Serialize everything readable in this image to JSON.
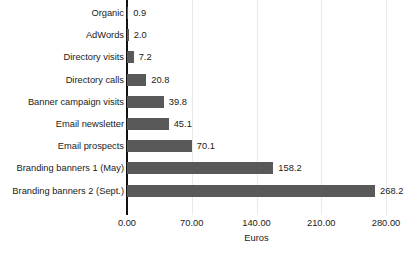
{
  "chart_data": {
    "type": "bar",
    "orientation": "horizontal",
    "title": "",
    "xlabel": "Euros",
    "ylabel": "",
    "categories": [
      "Organic",
      "AdWords",
      "Directory visits",
      "Directory calls",
      "Banner campaign visits",
      "Email newsletter",
      "Email prospects",
      "Branding banners 1 (May)",
      "Branding banners 2 (Sept.)"
    ],
    "values": [
      0.9,
      2.0,
      7.2,
      20.8,
      39.8,
      45.1,
      70.1,
      158.2,
      268.2
    ],
    "value_labels": [
      "0.9",
      "2.0",
      "7.2",
      "20.8",
      "39.8",
      "45.1",
      "70.1",
      "158.2",
      "268.2"
    ],
    "xticks": [
      0,
      70,
      140,
      210,
      280
    ],
    "xtick_labels": [
      "0.00",
      "70.00",
      "140.00",
      "210.00",
      "280.00"
    ],
    "xlim": [
      0,
      280
    ],
    "grid": true,
    "legend": false,
    "bar_color": "#595959",
    "axis_color": "#111111",
    "grid_color": "#e9e9e9",
    "text_color": "#1a1a1a",
    "background": "#ffffff"
  }
}
